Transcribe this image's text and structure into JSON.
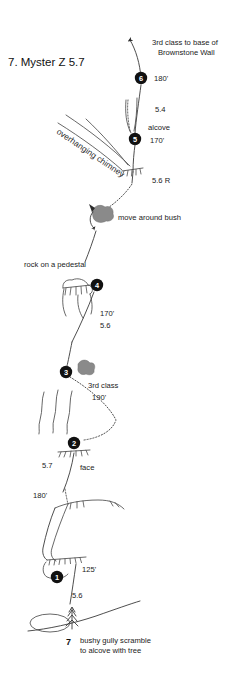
{
  "title": "7. Myster Z  5.7",
  "route_number": "7",
  "route_name": "Myster Z",
  "route_grade": "5.7",
  "colors": {
    "ink": "#1a1a1a",
    "rock": "#4d4d4d",
    "bush": "#8a8a8a",
    "node_fill": "#111111",
    "node_text": "#ffffff",
    "background": "#ffffff"
  },
  "top_annotation": {
    "line1": "3rd class to base of",
    "line2": "Brownstone Wall"
  },
  "belay_nodes": [
    {
      "id": "node-6",
      "label": "6",
      "length": "180'",
      "note": ""
    },
    {
      "id": "node-5",
      "label": "5",
      "length": "170'",
      "note": "alcove"
    },
    {
      "id": "node-4",
      "label": "4",
      "length": "170'",
      "note": "rock on a pedestal"
    },
    {
      "id": "node-3",
      "label": "3",
      "length": "190'",
      "note": "3rd class"
    },
    {
      "id": "node-2",
      "label": "2",
      "length": "180'",
      "note": "face"
    },
    {
      "id": "node-1",
      "label": "1",
      "length": "125'",
      "note": ""
    }
  ],
  "grades": {
    "above_node5": "5.4",
    "below_node5": "5.6 R",
    "below_node4": "5.6",
    "below_node2": "5.7",
    "below_node1": "5.6"
  },
  "lengths": {
    "pitch6": "180'",
    "pitch5": "170'",
    "pitch4": "170'",
    "pitch3": "190'",
    "pitch2": "180'",
    "pitch1": "125'"
  },
  "feature_labels": {
    "chimney": "overhanging chimney",
    "bush": "move around bush",
    "pedestal": "rock on a pedestal",
    "alcove": "alcove",
    "face": "face",
    "third_class": "3rd class"
  },
  "approach": {
    "marker": "7",
    "line1": "bushy gully scramble",
    "line2": "to alcove with tree"
  }
}
